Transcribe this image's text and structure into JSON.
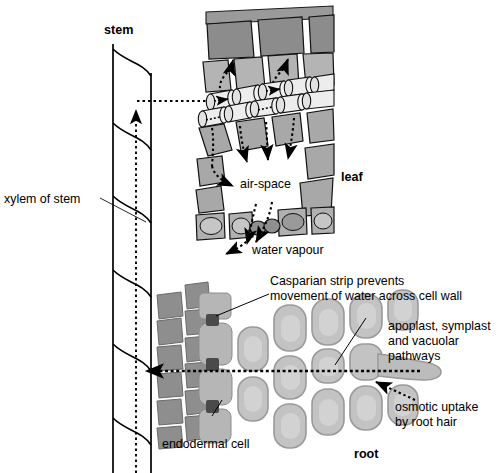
{
  "diagram": {
    "type": "biology-diagram",
    "background": "#ffffff"
  },
  "labels": {
    "stem": "stem",
    "leaf": "leaf",
    "root": "root",
    "xylem_of_stem": "xylem of stem",
    "air_space": "air-space",
    "water_vapour": "water vapour",
    "casparian_line1": "Casparian strip prevents",
    "casparian_line2": "movement of water across cell wall",
    "pathways_line1": "apoplast, symplast",
    "pathways_line2": "and vacuolar",
    "pathways_line3": "pathways",
    "osmotic_line1": "osmotic uptake",
    "osmotic_line2": "by root hair",
    "endodermal_cell": "endodermal cell"
  },
  "colors": {
    "ink": "#000000",
    "upper_epidermis": "#8c8c8c",
    "palisade": "#b4b4b4",
    "spongy": "#a8a8a8",
    "lower_epidermis": "#b0b0b0",
    "guard_cell": "#8f8f8f",
    "xylem_vessel": "#e8e8e8",
    "stele_cell": "#8e8e8e",
    "cortex_fill": "#c3c3c3",
    "cortex_inner": "#d2d2d2",
    "endodermis_fill": "#b6b6b6",
    "casparian_dot": "#4a4a4a",
    "root_hair": "#bcbcbc"
  },
  "structures": {
    "stem_xylem": "two vertical vessel walls with S-shaped perforated cross walls",
    "leaf_xylem_vessels": "two rows of cylindrical xylem vessel elements drawn in perspective",
    "stoma": "pair of guard cells in lower epidermis forming a pore",
    "root_hair": "elongated epidermal projection extending to the right",
    "casparian_strips": "dark blocks at endodermal cell junctions"
  },
  "flow_arrows": {
    "stem_up": "dotted arrow travelling up the stem xylem",
    "root_to_stem": "dotted arrow from root stele into stem xylem",
    "xylem_to_mesophyll": "dotted arrows from leaf xylem into mesophyll air spaces",
    "out_of_stoma": "dotted arrows of water vapour leaving through the stoma",
    "into_root_hair": "dotted arrow of osmotic uptake entering the root hair",
    "across_cortex": "dotted horizontal arrow crossing root cortex to the stele"
  }
}
